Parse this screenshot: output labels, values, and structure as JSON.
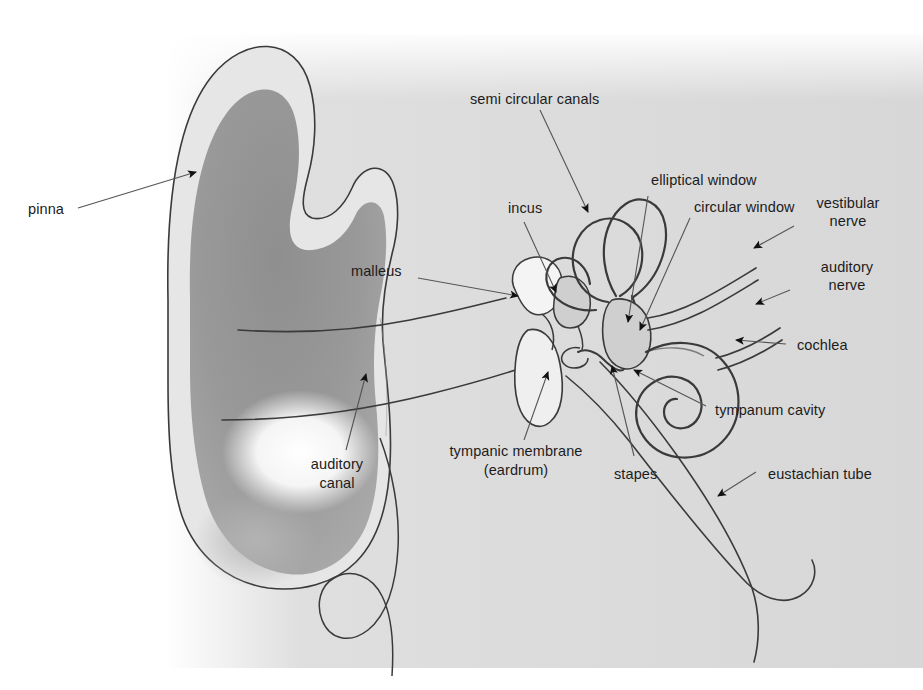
{
  "figure": {
    "background_color": "#ffffff",
    "tissue_color": "#d9d9d9",
    "concha_shadow_color": "#8c8c8c",
    "outline_color": "#3a3a3a",
    "label_color": "#1c1c1c",
    "width": 923,
    "height": 690
  },
  "labels": {
    "pinna": "pinna",
    "semi_circular_canals": "semi circular canals",
    "incus": "incus",
    "malleus": "malleus",
    "elliptical_window": "elliptical window",
    "circular_window": "circular window",
    "vestibular_nerve_line1": "vestibular",
    "vestibular_nerve_line2": "nerve",
    "auditory_nerve_line1": "auditory",
    "auditory_nerve_line2": "nerve",
    "cochlea": "cochlea",
    "tympanum_cavity": "tympanum cavity",
    "eustachian_tube": "eustachian tube",
    "stapes": "stapes",
    "tympanic_membrane_line1": "tympanic membrane",
    "tympanic_membrane_line2": "(eardrum)",
    "auditory_canal_line1": "auditory",
    "auditory_canal_line2": "canal"
  }
}
